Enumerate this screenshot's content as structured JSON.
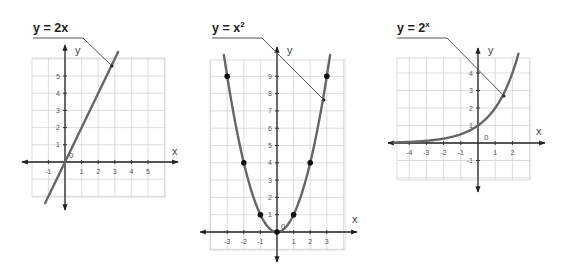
{
  "chart_data": [
    {
      "type": "line",
      "title": "y = 2x",
      "title_base": "y = 2x",
      "title_sup": "",
      "function": "2*x",
      "xlabel": "x",
      "ylabel": "y",
      "origin_label": "0",
      "xlim": [
        -1,
        5
      ],
      "ylim": [
        -1,
        5
      ],
      "x_ticks": [
        -1,
        1,
        2,
        3,
        4,
        5
      ],
      "y_ticks": [
        1,
        2,
        3,
        4,
        5
      ],
      "x_tick_labels": [
        "-1",
        "1",
        "2",
        "3",
        "4",
        "5"
      ],
      "y_tick_labels": [
        "1",
        "2",
        "3",
        "4",
        "5"
      ],
      "line_segment": {
        "x": [
          -1.2,
          3.2
        ],
        "y": [
          -2.4,
          6.4
        ]
      },
      "marked_points": [],
      "grid": true,
      "curve_color": "#666666"
    },
    {
      "type": "line",
      "title": "y = x²",
      "title_base": "y = x",
      "title_sup": "2",
      "function": "x^2",
      "xlabel": "x",
      "ylabel": "y",
      "origin_label": "0",
      "xlim": [
        -3,
        3
      ],
      "ylim": [
        0,
        9
      ],
      "x_ticks": [
        -3,
        -2,
        -1,
        1,
        2,
        3
      ],
      "y_ticks": [
        1,
        2,
        3,
        4,
        5,
        6,
        7,
        8,
        9
      ],
      "x_tick_labels": [
        "-3",
        "-2",
        "-1",
        "1",
        "2",
        "3"
      ],
      "y_tick_labels": [
        "1",
        "2",
        "3",
        "4",
        "5",
        "6",
        "7",
        "8",
        "9"
      ],
      "marked_points": [
        {
          "x": -3,
          "y": 9
        },
        {
          "x": -2,
          "y": 4
        },
        {
          "x": -1,
          "y": 1
        },
        {
          "x": 0,
          "y": 0
        },
        {
          "x": 1,
          "y": 1
        },
        {
          "x": 2,
          "y": 4
        },
        {
          "x": 3,
          "y": 9
        }
      ],
      "grid": true,
      "curve_color": "#666666"
    },
    {
      "type": "line",
      "title": "y = 2ˣ",
      "title_base": "y = 2",
      "title_sup": "x",
      "function": "2^x",
      "xlabel": "x",
      "ylabel": "y",
      "origin_label": "0",
      "xlim": [
        -4,
        2
      ],
      "ylim": [
        -1,
        4
      ],
      "x_ticks": [
        -4,
        -3,
        -2,
        -1,
        1,
        2
      ],
      "y_ticks": [
        -1,
        1,
        2,
        3,
        4
      ],
      "x_tick_labels": [
        "-4",
        "-3",
        "-2",
        "-1",
        "1",
        "2"
      ],
      "y_tick_labels": [
        "-1",
        "1",
        "2",
        "3",
        "4"
      ],
      "marked_points": [],
      "grid": true,
      "curve_color": "#666666"
    }
  ],
  "graphs": [
    {
      "title_base": "y = 2x",
      "title_sup": "",
      "xlabel": "x",
      "ylabel": "y",
      "origin": "0"
    },
    {
      "title_base": "y = x",
      "title_sup": "2",
      "xlabel": "x",
      "ylabel": "y",
      "origin": "0"
    },
    {
      "title_base": "y = 2",
      "title_sup": "x",
      "xlabel": "x",
      "ylabel": "y",
      "origin": "0"
    }
  ]
}
